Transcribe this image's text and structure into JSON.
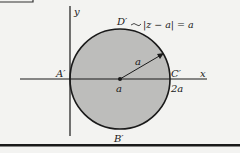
{
  "diagram": {
    "axes": {
      "x_label": "x",
      "y_label": "y"
    },
    "circle": {
      "equation": "|z − a| = a",
      "curve_label": "D′",
      "fill_color": "#bdbdbb",
      "stroke_color": "#1a1a1a",
      "radius_label": "a",
      "center_label": "a"
    },
    "points": {
      "A": "A′",
      "B": "B′",
      "C": "C′",
      "C_value": "2a"
    }
  }
}
